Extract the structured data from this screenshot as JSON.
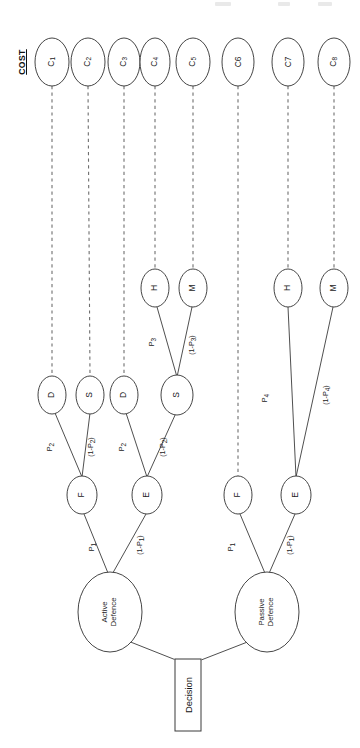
{
  "diagram": {
    "orientation": "rotated-90-text-bottom-to-top",
    "cost_header": "COST",
    "root": {
      "label": "Decision"
    },
    "colors": {
      "stroke": "#3b3b3b",
      "dashed_stroke": "#6e6e6e",
      "text": "#1a1a1a",
      "background": "#ffffff"
    },
    "nodes": {
      "decision": {
        "name": "Decision",
        "label": "Decision",
        "shape": "rectangle",
        "x": 188,
        "y": 695
      },
      "branches": [
        {
          "name": "active-defence",
          "label_line1": "Active",
          "label_line2": "Defence",
          "shape": "ellipse",
          "x": 110,
          "y": 612
        },
        {
          "name": "passive-defence",
          "label_line1": "Passive",
          "label_line2": "Defence",
          "shape": "ellipse",
          "x": 267,
          "y": 612
        }
      ],
      "level_fe": [
        {
          "name": "active-F",
          "label": "F",
          "x": 82,
          "y": 495
        },
        {
          "name": "active-E",
          "label": "E",
          "x": 147,
          "y": 495
        },
        {
          "name": "passive-F",
          "label": "F",
          "x": 238,
          "y": 495
        },
        {
          "name": "passive-E",
          "label": "E",
          "x": 296,
          "y": 495
        }
      ],
      "level_ds": [
        {
          "name": "ds-D-1",
          "label": "D",
          "x": 52,
          "y": 395
        },
        {
          "name": "ds-S-1",
          "label": "S",
          "x": 90,
          "y": 395
        },
        {
          "name": "ds-D-2",
          "label": "D",
          "x": 124,
          "y": 395
        },
        {
          "name": "ds-S-2",
          "label": "S",
          "x": 177,
          "y": 395
        }
      ],
      "level_hm": [
        {
          "name": "hm-H-1",
          "label": "H",
          "x": 155,
          "y": 288
        },
        {
          "name": "hm-M-1",
          "label": "M",
          "x": 193,
          "y": 288
        },
        {
          "name": "hm-H-2",
          "label": "H",
          "x": 288,
          "y": 288
        },
        {
          "name": "hm-M-2",
          "label": "M",
          "x": 334,
          "y": 288
        }
      ],
      "costs": [
        {
          "name": "cost-c1",
          "label": "C",
          "subscript": "1",
          "x": 52,
          "y": 62
        },
        {
          "name": "cost-c2",
          "label": "C",
          "subscript": "2",
          "x": 88,
          "y": 62
        },
        {
          "name": "cost-c3",
          "label": "C",
          "subscript": "3",
          "x": 124,
          "y": 62
        },
        {
          "name": "cost-c4",
          "label": "C",
          "subscript": "4",
          "x": 155,
          "y": 62
        },
        {
          "name": "cost-c5",
          "label": "C",
          "subscript": "5",
          "x": 193,
          "y": 62
        },
        {
          "name": "cost-c6",
          "label": "C6",
          "subscript": "",
          "x": 238,
          "y": 62
        },
        {
          "name": "cost-c7",
          "label": "C7",
          "subscript": "",
          "x": 288,
          "y": 62
        },
        {
          "name": "cost-c8",
          "label": "C",
          "subscript": "8",
          "x": 334,
          "y": 62
        }
      ]
    },
    "edge_labels": [
      {
        "name": "edge-label-p1-active",
        "text": "P",
        "sub": "1",
        "suffix": "",
        "prefix": "",
        "x": 92,
        "y": 547
      },
      {
        "name": "edge-label-1mp1-active",
        "text": "P",
        "sub": "1",
        "suffix": ")",
        "prefix": "(1-",
        "x": 140,
        "y": 545
      },
      {
        "name": "edge-label-p1-passive",
        "text": "P",
        "sub": "1",
        "suffix": "",
        "prefix": "",
        "x": 231,
        "y": 547
      },
      {
        "name": "edge-label-1mp1-passive",
        "text": "P",
        "sub": "1",
        "suffix": ")",
        "prefix": "(1-",
        "x": 290,
        "y": 545
      },
      {
        "name": "edge-label-p2-left",
        "text": "P",
        "sub": "2",
        "suffix": "",
        "prefix": "",
        "x": 50,
        "y": 447
      },
      {
        "name": "edge-label-1mp2-left",
        "text": "P",
        "sub": "2",
        "suffix": ")",
        "prefix": "(1-",
        "x": 91,
        "y": 447
      },
      {
        "name": "edge-label-p2-right",
        "text": "P",
        "sub": "2",
        "suffix": "",
        "prefix": "",
        "x": 122,
        "y": 447
      },
      {
        "name": "edge-label-1mp2-right",
        "text": "P",
        "sub": "2",
        "suffix": ")",
        "prefix": "(1-",
        "x": 163,
        "y": 447
      },
      {
        "name": "edge-label-p3",
        "text": "P",
        "sub": "3",
        "suffix": "",
        "prefix": "",
        "x": 152,
        "y": 342
      },
      {
        "name": "edge-label-1mp3",
        "text": "P",
        "sub": "3",
        "suffix": ")",
        "prefix": "(1-",
        "x": 192,
        "y": 345
      },
      {
        "name": "edge-label-p4",
        "text": "P",
        "sub": "4",
        "suffix": "",
        "prefix": "",
        "x": 265,
        "y": 398
      },
      {
        "name": "edge-label-1mp4",
        "text": "P",
        "sub": "4",
        "suffix": ")",
        "prefix": "(1-",
        "x": 326,
        "y": 395
      }
    ],
    "cost_header_pos": {
      "x": 22,
      "y": 62
    }
  }
}
